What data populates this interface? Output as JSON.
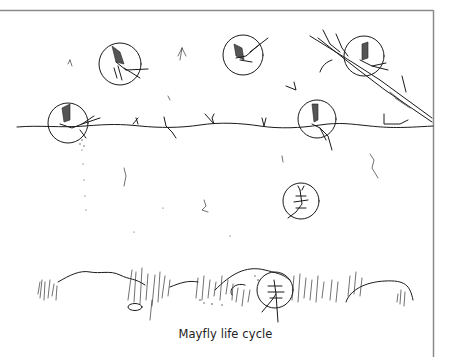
{
  "figure": {
    "caption": "Mayfly life cycle",
    "style": "hand-drawn pen illustration",
    "colors": {
      "ink": "#1a1a1a",
      "frame": "#8a8a8a",
      "background": "#ffffff"
    }
  },
  "scene": {
    "zones": [
      "air",
      "water-surface",
      "water-column",
      "stream-bed"
    ],
    "highlighted_stages": [
      {
        "id": "adult-flying-1",
        "label": "adult in flight",
        "circle": {
          "cx": 120,
          "cy": 64,
          "r": 21
        }
      },
      {
        "id": "adult-flying-2",
        "label": "adult in flight",
        "circle": {
          "cx": 243,
          "cy": 55,
          "r": 20
        }
      },
      {
        "id": "subimago-on-branch",
        "label": "subimago resting on branch",
        "circle": {
          "cx": 364,
          "cy": 56,
          "r": 20
        }
      },
      {
        "id": "spent-adult-left",
        "label": "egg-laying adult on water",
        "circle": {
          "cx": 68,
          "cy": 123,
          "r": 20
        }
      },
      {
        "id": "emerging-dun",
        "label": "emerging dun at surface",
        "circle": {
          "cx": 317,
          "cy": 119,
          "r": 19
        }
      },
      {
        "id": "nymph-swimming",
        "label": "nymph in water column",
        "circle": {
          "cx": 301,
          "cy": 201,
          "r": 18
        }
      },
      {
        "id": "nymph-bottom",
        "label": "nymph on stream bed",
        "circle": {
          "cx": 275,
          "cy": 290,
          "r": 18
        }
      }
    ]
  }
}
